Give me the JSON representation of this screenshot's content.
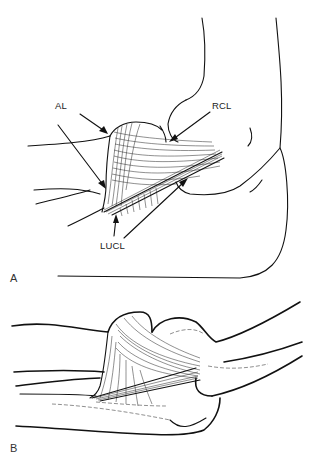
{
  "figure": {
    "type": "anatomical line drawing",
    "panels": [
      {
        "id": "A",
        "label": "A",
        "annotations": [
          {
            "text": "AL",
            "meaning_hint": "arrows to annular ligament"
          },
          {
            "text": "RCL",
            "meaning_hint": "arrow to radial collateral ligament"
          },
          {
            "text": "LUCL",
            "meaning_hint": "arrows to lateral ulnar collateral ligament"
          }
        ]
      },
      {
        "id": "B",
        "label": "B",
        "annotations": []
      }
    ]
  }
}
